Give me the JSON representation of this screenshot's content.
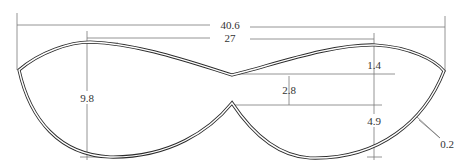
{
  "drawing": {
    "type": "technical-dimension-drawing",
    "subject": "eye-mask / bra-cup outline with double-line contour",
    "colors": {
      "outline": "#2b2b2b",
      "dimension_lines": "#7a7a7a",
      "text": "#333333",
      "background": "#ffffff"
    },
    "dimensions": {
      "overall_width": "40.6",
      "peak_to_peak": "27",
      "dip_depth": "1.4",
      "center_gap": "2.8",
      "cup_height": "9.8",
      "lower_notch_depth": "4.9",
      "wall_thickness": "0.2"
    }
  }
}
